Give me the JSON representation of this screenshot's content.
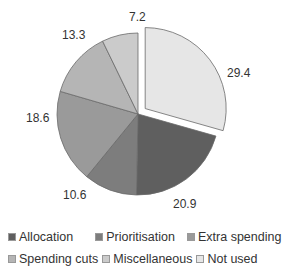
{
  "chart_data": {
    "type": "pie",
    "title": "",
    "categories": [
      "Allocation",
      "Prioritisation",
      "Extra spending",
      "Spending cuts",
      "Miscellaneous",
      "Not used"
    ],
    "values": [
      20.9,
      10.6,
      18.6,
      13.3,
      7.2,
      29.4
    ],
    "colors": [
      "#5f5f5f",
      "#7d7d7d",
      "#9a9a9a",
      "#b5b5b5",
      "#cbcbcb",
      "#e6e6e6"
    ],
    "exploded": [
      "Not used"
    ],
    "data_labels": [
      "20.9",
      "10.6",
      "18.6",
      "13.3",
      "7.2",
      "29.4"
    ],
    "legend_position": "bottom",
    "start_angle": 0,
    "direction": "clockwise",
    "order_clockwise_from_top": [
      "Not used",
      "Allocation",
      "Prioritisation",
      "Extra spending",
      "Spending cuts",
      "Miscellaneous"
    ]
  },
  "legend": {
    "rows": [
      [
        {
          "label": "Allocation",
          "color": "#5f5f5f"
        },
        {
          "label": "Prioritisation",
          "color": "#7d7d7d"
        },
        {
          "label": "Extra spending",
          "color": "#9a9a9a"
        }
      ],
      [
        {
          "label": "Spending cuts",
          "color": "#b5b5b5"
        },
        {
          "label": "Miscellaneous",
          "color": "#cbcbcb"
        },
        {
          "label": "Not used",
          "color": "#e6e6e6"
        }
      ]
    ]
  },
  "labels": {
    "not_used": "29.4",
    "allocation": "20.9",
    "prioritisation": "10.6",
    "extra_spending": "18.6",
    "spending_cuts": "13.3",
    "miscellaneous": "7.2"
  }
}
